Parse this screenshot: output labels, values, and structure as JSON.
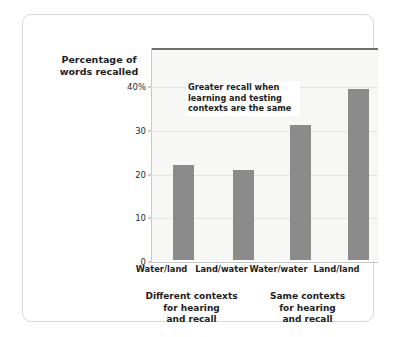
{
  "axis_title": {
    "line1": "Percentage of",
    "line2": "words recalled"
  },
  "annotation": {
    "line1": "Greater recall when",
    "line2": "learning and testing",
    "line3": "contexts are the same"
  },
  "groups": [
    {
      "line1": "Different contexts",
      "line2": "for hearing",
      "line3": "and recall"
    },
    {
      "line1": "Same contexts",
      "line2": "for hearing",
      "line3": "and recall"
    }
  ],
  "y_tick_labels": [
    "0",
    "10",
    "20",
    "30",
    "40%"
  ],
  "colors": {
    "bar": "#8b8b8b",
    "plot_background": "#f7f7f5",
    "gridline": "#e3e3e1",
    "top_border": "#6e6e6e",
    "frame_border": "#d8d8d8",
    "text": "#1d1d1d"
  },
  "chart_data": {
    "type": "bar",
    "title": "",
    "xlabel": "",
    "ylabel": "Percentage of words recalled",
    "categories": [
      "Water/land",
      "Land/water",
      "Water/water",
      "Land/land"
    ],
    "values": [
      21.7,
      20.7,
      30.8,
      39.2
    ],
    "ylim": [
      0,
      48.5
    ],
    "yticks": [
      0,
      10,
      20,
      30,
      40
    ],
    "ytick_labels": [
      "0",
      "10",
      "20",
      "30",
      "40%"
    ],
    "grid": true,
    "legend": "none",
    "group_labels": [
      "Different contexts for hearing and recall",
      "Same contexts for hearing and recall"
    ],
    "group_spans": [
      [
        0,
        1
      ],
      [
        2,
        3
      ]
    ],
    "annotations": [
      {
        "text": "Greater recall when learning and testing contexts are the same",
        "x_category": "Land/water",
        "y_value": 44
      }
    ]
  }
}
